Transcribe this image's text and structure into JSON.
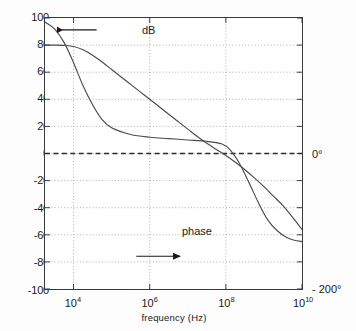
{
  "figure": {
    "type": "bode-plot",
    "background": "#ffffff",
    "frame_color": "#3a3a3a",
    "grid_color": "#9a9a9a",
    "curve_color": "#4a4a4a"
  },
  "axes": {
    "x_title": "frequency  (Hz)",
    "x_ticks": [
      {
        "mantissa": "10",
        "exponent": "4",
        "value": 4
      },
      {
        "mantissa": "10",
        "exponent": "6",
        "value": 6
      },
      {
        "mantissa": "10",
        "exponent": "8",
        "value": 8
      },
      {
        "mantissa": "10",
        "exponent": "10",
        "value": 10
      }
    ],
    "y_ticks": [
      "100",
      "80",
      "60",
      "40",
      "20",
      "0",
      "-20",
      "-40",
      "-60",
      "-80",
      "-100"
    ],
    "right_labels": [
      {
        "text": "0°",
        "at_left_value": 0
      },
      {
        "text": "- 200°",
        "at_left_value": -100
      }
    ]
  },
  "annotations": {
    "db_label": "dB",
    "db_arrow": "arrow-left",
    "phase_label": "phase",
    "phase_arrow": "arrow-right"
  },
  "chart_data": {
    "type": "line",
    "title": "",
    "subtitle": "",
    "xlabel": "frequency  (Hz)",
    "ylabel": "dB",
    "y2label": "phase (degrees)",
    "xscale": "log",
    "xlim": [
      1778,
      10000000000
    ],
    "ylim": [
      -100,
      100
    ],
    "y2lim": [
      -200,
      0
    ],
    "grid": true,
    "legend": "none",
    "xticks": [
      10000,
      1000000,
      100000000,
      10000000000
    ],
    "xticklabels": [
      "10^4",
      "10^6",
      "10^8",
      "10^10"
    ],
    "yticks": [
      -100,
      -80,
      -60,
      -40,
      -20,
      0,
      20,
      40,
      60,
      80,
      100
    ],
    "yticklabels": [
      "-100",
      "-80",
      "-60",
      "-40",
      "-20",
      "0",
      "20",
      "40",
      "60",
      "80",
      "100"
    ],
    "reference_lines": [
      {
        "axis": "y",
        "value": 0,
        "style": "dashed",
        "label": "0 dB / 0°"
      }
    ],
    "series": [
      {
        "name": "dB",
        "axis": "left",
        "unit": "dB",
        "annotation": "dB",
        "arrow": "left",
        "points": [
          {
            "log_f": 3.25,
            "y": 80.0
          },
          {
            "log_f": 3.5,
            "y": 80.0
          },
          {
            "log_f": 3.75,
            "y": 79.8
          },
          {
            "log_f": 4.0,
            "y": 79.0
          },
          {
            "log_f": 4.25,
            "y": 76.5
          },
          {
            "log_f": 4.5,
            "y": 72.5
          },
          {
            "log_f": 4.75,
            "y": 67.5
          },
          {
            "log_f": 5.0,
            "y": 62.0
          },
          {
            "log_f": 5.25,
            "y": 56.5
          },
          {
            "log_f": 5.5,
            "y": 51.0
          },
          {
            "log_f": 5.75,
            "y": 45.5
          },
          {
            "log_f": 6.0,
            "y": 40.0
          },
          {
            "log_f": 6.25,
            "y": 34.5
          },
          {
            "log_f": 6.5,
            "y": 29.0
          },
          {
            "log_f": 6.75,
            "y": 23.5
          },
          {
            "log_f": 7.0,
            "y": 18.0
          },
          {
            "log_f": 7.25,
            "y": 12.5
          },
          {
            "log_f": 7.5,
            "y": 7.5
          },
          {
            "log_f": 7.75,
            "y": 3.0
          },
          {
            "log_f": 8.0,
            "y": -1.5
          },
          {
            "log_f": 8.25,
            "y": -6.5
          },
          {
            "log_f": 8.5,
            "y": -12.0
          },
          {
            "log_f": 8.75,
            "y": -18.0
          },
          {
            "log_f": 9.0,
            "y": -24.5
          },
          {
            "log_f": 9.25,
            "y": -31.5
          },
          {
            "log_f": 9.5,
            "y": -38.5
          },
          {
            "log_f": 9.75,
            "y": -47.0
          },
          {
            "log_f": 10.0,
            "y": -56.0
          }
        ]
      },
      {
        "name": "phase",
        "axis": "right",
        "unit": "degrees",
        "annotation": "phase",
        "arrow": "right",
        "points": [
          {
            "log_f": 3.25,
            "y": -3
          },
          {
            "log_f": 3.5,
            "y": -8
          },
          {
            "log_f": 3.75,
            "y": -18
          },
          {
            "log_f": 4.0,
            "y": -33
          },
          {
            "log_f": 4.25,
            "y": -50
          },
          {
            "log_f": 4.5,
            "y": -64
          },
          {
            "log_f": 4.75,
            "y": -75
          },
          {
            "log_f": 5.0,
            "y": -81
          },
          {
            "log_f": 5.5,
            "y": -86
          },
          {
            "log_f": 6.0,
            "y": -88
          },
          {
            "log_f": 6.5,
            "y": -89
          },
          {
            "log_f": 7.0,
            "y": -90
          },
          {
            "log_f": 7.5,
            "y": -91
          },
          {
            "log_f": 7.9,
            "y": -93
          },
          {
            "log_f": 8.1,
            "y": -97
          },
          {
            "log_f": 8.35,
            "y": -107
          },
          {
            "log_f": 8.6,
            "y": -121
          },
          {
            "log_f": 8.85,
            "y": -136
          },
          {
            "log_f": 9.1,
            "y": -149
          },
          {
            "log_f": 9.35,
            "y": -157
          },
          {
            "log_f": 9.6,
            "y": -162
          },
          {
            "log_f": 9.8,
            "y": -164
          },
          {
            "log_f": 10.0,
            "y": -165
          }
        ]
      }
    ]
  }
}
